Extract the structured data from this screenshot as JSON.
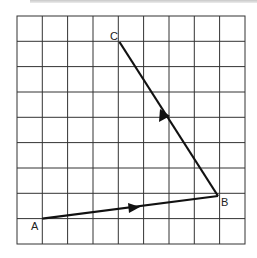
{
  "diagram": {
    "type": "vector-grid",
    "grid": {
      "columns": 9,
      "rows": 9,
      "origin_px": [
        17,
        16
      ],
      "cell_w": 25.3,
      "cell_h": 25.3,
      "line_color": "#333333"
    },
    "points": [
      {
        "label": "A",
        "col": 1,
        "row": 8
      },
      {
        "label": "B",
        "col": 8,
        "row": 7
      },
      {
        "label": "C",
        "col": 4,
        "row": 1
      }
    ],
    "vectors": [
      {
        "from": "A",
        "to": "B",
        "arrow_direction": "A to B"
      },
      {
        "from": "B",
        "to": "C",
        "arrow_direction": "B to C"
      }
    ],
    "labels": {
      "a": "A",
      "b": "B",
      "c": "C"
    },
    "stroke_color": "#111111"
  }
}
